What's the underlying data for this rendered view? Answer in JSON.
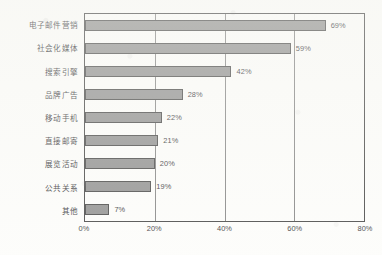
{
  "chart_data": {
    "type": "bar",
    "orientation": "horizontal",
    "title": "",
    "subtitle": "",
    "xlabel": "",
    "ylabel": "",
    "xlim": [
      0,
      80
    ],
    "xticks": [
      0,
      20,
      40,
      60,
      80
    ],
    "xtick_labels": [
      "0%",
      "20%",
      "40%",
      "60%",
      "80%"
    ],
    "grid": "vertical",
    "legend": "none",
    "value_label_suffix": "%",
    "categories": [
      "电子邮件营销",
      "社会化媒体",
      "搜索引擎",
      "品牌广告",
      "移动手机",
      "直接邮寄",
      "展览活动",
      "公共关系",
      "其他"
    ],
    "values": [
      69,
      59,
      42,
      28,
      22,
      21,
      20,
      19,
      7
    ],
    "value_labels": [
      "69%",
      "59%",
      "42%",
      "28%",
      "22%",
      "21%",
      "20%",
      "19%",
      "7%"
    ],
    "series": [
      {
        "name": "",
        "values": [
          69,
          59,
          42,
          28,
          22,
          21,
          20,
          19,
          7
        ]
      }
    ]
  },
  "style": {
    "bar_fill": "#828282",
    "bar_stroke": "#2e2e2e",
    "frame_color": "#2a2a2a",
    "gridline_color": "#5a5a5a",
    "text_color": "#141418",
    "background": "#fdfdfb"
  }
}
